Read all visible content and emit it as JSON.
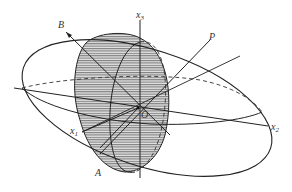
{
  "figure": {
    "colors": {
      "stroke": "#222222",
      "hatch": "#555555",
      "fill": "#d8d8d8",
      "background": "#ffffff"
    },
    "labels": {
      "B": "B",
      "x3_main": "x",
      "x3_sub": "3",
      "P": "P",
      "O": "O",
      "x1_main": "x",
      "x1_sub": "1",
      "A": "A",
      "x2_main": "x",
      "x2_sub": "2"
    }
  }
}
